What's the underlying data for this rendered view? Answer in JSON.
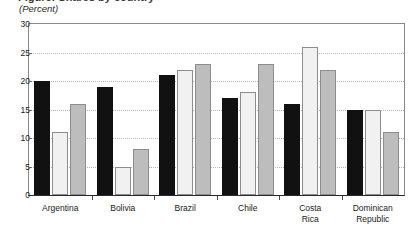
{
  "figure": {
    "title_cropped": "Figure: Shares by country",
    "axis_unit_label": "(Percent)"
  },
  "chart_data": {
    "type": "bar",
    "title": "",
    "subtitle": "",
    "xlabel": "",
    "ylabel": "(Percent)",
    "ylim": [
      0,
      30
    ],
    "ytick_values": [
      0,
      5,
      10,
      15,
      20,
      25,
      30
    ],
    "ytick_labels": [
      "0",
      "5",
      "10",
      "15",
      "20",
      "25",
      "30"
    ],
    "grid": true,
    "grid_axis": "y",
    "grid_style": "dotted",
    "legend": false,
    "legend_position": "none",
    "categories": [
      "Argentina",
      "Bolivia",
      "Brazil",
      "Chile",
      "Costa\nRica",
      "Dominican\nRepublic"
    ],
    "series": [
      {
        "name": "series-1",
        "color": "#111111",
        "values": [
          20,
          19,
          21,
          17,
          16,
          15
        ]
      },
      {
        "name": "series-2",
        "color": "#f1f1f1",
        "values": [
          11,
          5,
          22,
          18,
          26,
          15
        ]
      },
      {
        "name": "series-3",
        "color": "#bdbdbd",
        "values": [
          16,
          8,
          23,
          23,
          22,
          11
        ]
      }
    ]
  },
  "colors": {
    "series_1": "#111111",
    "series_2": "#f1f1f1",
    "series_3": "#bdbdbd",
    "bar_outline": "#8d8d8d",
    "gridline": "#b4b4b4",
    "axis": "#2a2a2a",
    "frame": "#8a8a8a",
    "background": "#ffffff",
    "text": "#1a1a1a"
  }
}
